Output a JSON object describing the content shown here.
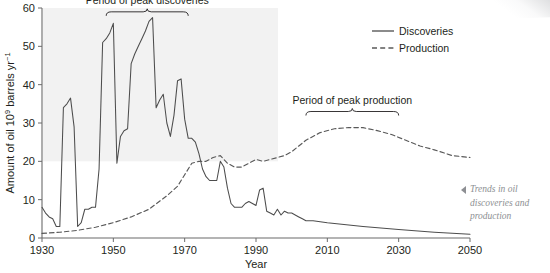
{
  "chart_data": {
    "type": "line",
    "title": "",
    "xlabel": "Year",
    "ylabel": "Amount of oil 10⁹ barrels yr⁻¹",
    "ylabel_main": "Amount of oil 10",
    "ylabel_sup1": "9",
    "ylabel_mid": " barrels yr",
    "ylabel_sup2": "−1",
    "xlim": [
      1930,
      2050
    ],
    "ylim": [
      0,
      60
    ],
    "xticks": [
      1930,
      1950,
      1970,
      1990,
      2010,
      2030,
      2050
    ],
    "yticks": [
      0,
      10,
      20,
      30,
      40,
      50,
      60
    ],
    "grid": false,
    "legend_position": "top-right",
    "series": [
      {
        "name": "Discoveries",
        "style": "solid",
        "color": "#4d4d4d",
        "points": [
          [
            1930,
            8.0
          ],
          [
            1931,
            6.5
          ],
          [
            1932,
            5.5
          ],
          [
            1933,
            5.0
          ],
          [
            1934,
            3.0
          ],
          [
            1935,
            3.0
          ],
          [
            1936,
            34.0
          ],
          [
            1937,
            35.0
          ],
          [
            1938,
            36.5
          ],
          [
            1939,
            29.0
          ],
          [
            1940,
            3.0
          ],
          [
            1941,
            4.0
          ],
          [
            1942,
            7.5
          ],
          [
            1943,
            7.5
          ],
          [
            1944,
            8.0
          ],
          [
            1945,
            8.0
          ],
          [
            1946,
            18.0
          ],
          [
            1947,
            51.0
          ],
          [
            1948,
            52.0
          ],
          [
            1949,
            53.5
          ],
          [
            1950,
            56.0
          ],
          [
            1951,
            19.5
          ],
          [
            1952,
            26.5
          ],
          [
            1953,
            28.0
          ],
          [
            1954,
            28.5
          ],
          [
            1955,
            45.5
          ],
          [
            1956,
            48.0
          ],
          [
            1957,
            50.0
          ],
          [
            1958,
            52.0
          ],
          [
            1959,
            54.0
          ],
          [
            1960,
            56.5
          ],
          [
            1961,
            57.5
          ],
          [
            1962,
            34.0
          ],
          [
            1963,
            36.0
          ],
          [
            1964,
            37.5
          ],
          [
            1965,
            30.0
          ],
          [
            1966,
            26.5
          ],
          [
            1967,
            32.0
          ],
          [
            1968,
            41.0
          ],
          [
            1969,
            41.5
          ],
          [
            1970,
            31.0
          ],
          [
            1971,
            26.0
          ],
          [
            1972,
            26.0
          ],
          [
            1973,
            25.0
          ],
          [
            1974,
            22.0
          ],
          [
            1975,
            18.0
          ],
          [
            1976,
            16.0
          ],
          [
            1977,
            15.0
          ],
          [
            1978,
            15.0
          ],
          [
            1979,
            15.0
          ],
          [
            1980,
            20.0
          ],
          [
            1981,
            18.5
          ],
          [
            1982,
            13.0
          ],
          [
            1983,
            9.0
          ],
          [
            1984,
            8.0
          ],
          [
            1985,
            8.0
          ],
          [
            1986,
            8.0
          ],
          [
            1987,
            9.0
          ],
          [
            1988,
            9.5
          ],
          [
            1989,
            9.0
          ],
          [
            1990,
            8.5
          ],
          [
            1991,
            12.5
          ],
          [
            1992,
            13.0
          ],
          [
            1993,
            7.0
          ],
          [
            1994,
            6.5
          ],
          [
            1995,
            6.0
          ],
          [
            1996,
            7.5
          ],
          [
            1997,
            6.0
          ],
          [
            1998,
            7.0
          ],
          [
            1999,
            6.5
          ],
          [
            2000,
            6.5
          ],
          [
            2001,
            6.0
          ],
          [
            2002,
            5.5
          ],
          [
            2003,
            5.0
          ],
          [
            2004,
            4.5
          ],
          [
            2005,
            4.5
          ],
          [
            2006,
            4.5
          ],
          [
            2010,
            4.0
          ],
          [
            2020,
            3.0
          ],
          [
            2030,
            2.2
          ],
          [
            2040,
            1.5
          ],
          [
            2050,
            1.0
          ]
        ]
      },
      {
        "name": "Production",
        "style": "dashed",
        "color": "#595959",
        "points": [
          [
            1930,
            1.2
          ],
          [
            1935,
            1.5
          ],
          [
            1940,
            2.0
          ],
          [
            1945,
            2.8
          ],
          [
            1950,
            4.0
          ],
          [
            1955,
            5.5
          ],
          [
            1960,
            7.5
          ],
          [
            1965,
            11.0
          ],
          [
            1968,
            13.5
          ],
          [
            1970,
            16.5
          ],
          [
            1972,
            19.5
          ],
          [
            1974,
            20.0
          ],
          [
            1976,
            20.0
          ],
          [
            1978,
            21.0
          ],
          [
            1980,
            21.5
          ],
          [
            1982,
            19.5
          ],
          [
            1984,
            18.5
          ],
          [
            1986,
            18.5
          ],
          [
            1988,
            19.5
          ],
          [
            1990,
            20.5
          ],
          [
            1992,
            20.0
          ],
          [
            1994,
            20.5
          ],
          [
            1996,
            21.0
          ],
          [
            1998,
            21.5
          ],
          [
            2000,
            22.5
          ],
          [
            2004,
            25.5
          ],
          [
            2008,
            27.5
          ],
          [
            2012,
            28.5
          ],
          [
            2016,
            28.8
          ],
          [
            2020,
            28.8
          ],
          [
            2024,
            28.0
          ],
          [
            2028,
            27.0
          ],
          [
            2032,
            25.5
          ],
          [
            2036,
            24.0
          ],
          [
            2040,
            23.0
          ],
          [
            2045,
            21.5
          ],
          [
            2050,
            21.0
          ]
        ]
      }
    ],
    "annotations": [
      {
        "label": "Period of peak discoveries",
        "bracket_start_year": 1948,
        "bracket_end_year": 1971,
        "bracket_y": 59.0
      },
      {
        "label": "Period of peak production",
        "bracket_start_year": 2004,
        "bracket_end_year": 2030,
        "bracket_y": 33.0
      }
    ]
  },
  "legend": {
    "items": [
      {
        "label": "Discoveries",
        "style": "solid"
      },
      {
        "label": "Production",
        "style": "dashed"
      }
    ]
  },
  "caption": {
    "text": "Trends in oil discoveries and production",
    "arrow": "left-triangle-marker"
  },
  "colors": {
    "line": "#4d4d4d",
    "axis": "#6b6b6b",
    "text": "#231f20",
    "caption": "#8d8f93",
    "plot_band": "#f2f2f2"
  }
}
